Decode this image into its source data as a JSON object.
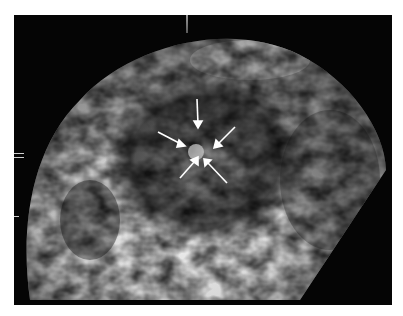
{
  "image": {
    "description": "Grayscale ultrasound volume rendering with six arrows pointing at a central focal lesion",
    "colors": {
      "background": "#ffffff",
      "frame": "#050505",
      "tissue_dark": "#2a2a2a",
      "tissue_mid": "#7a7a7a",
      "tissue_bright": "#e6e6e6",
      "arrow": "#ffffff"
    },
    "arrows": [
      {
        "name": "arrow-top",
        "x1": 197,
        "y1": 99,
        "x2": 198,
        "y2": 126
      },
      {
        "name": "arrow-upper-left",
        "x1": 158,
        "y1": 132,
        "x2": 183,
        "y2": 145
      },
      {
        "name": "arrow-upper-right",
        "x1": 235,
        "y1": 127,
        "x2": 217,
        "y2": 145
      },
      {
        "name": "arrow-lower-left",
        "x1": 180,
        "y1": 178,
        "x2": 196,
        "y2": 159
      },
      {
        "name": "arrow-lower-right",
        "x1": 227,
        "y1": 183,
        "x2": 207,
        "y2": 161
      }
    ],
    "target": {
      "cx": 196,
      "cy": 152
    }
  }
}
